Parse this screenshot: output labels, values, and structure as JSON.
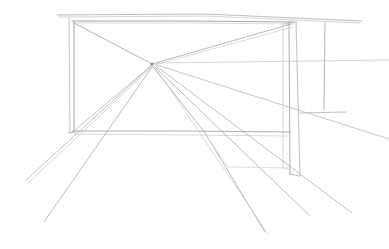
{
  "artwork": {
    "title": "One-point perspective room sketch",
    "medium": "graphite pencil on white paper",
    "subject": "interior architectural perspective construction with central vanishing point",
    "background_color": "#ffffff",
    "canvas": {
      "width": 389,
      "height": 249
    }
  },
  "palette": {
    "paper": "#ffffff",
    "line_dark": "#8d8d94",
    "line_mid": "#a9a9b0",
    "line_light": "#c2c2c8",
    "line_faint": "#d5d5da"
  },
  "geometry": {
    "vanishing_point": {
      "x": 152,
      "y": 64,
      "label": "VP"
    },
    "back_wall_rect": {
      "left": 72,
      "top": 21,
      "right": 294,
      "bottom": 133,
      "label": "back wall rectangle"
    },
    "horizon_line_y": 64
  },
  "strokes": [
    {
      "name": "ceiling-edge-upper-long",
      "d": "M 57 15 L 205 14 L 362 21",
      "color": "#a9a9b0",
      "width": 0.8
    },
    {
      "name": "ceiling-edge-lower-long",
      "d": "M 59 17 L 206 16 L 360 23",
      "color": "#c2c2c8",
      "width": 0.7
    },
    {
      "name": "back-wall-top-edge",
      "d": "M 72 21 L 186 21 L 294 22",
      "color": "#9a9aa2",
      "width": 0.9
    },
    {
      "name": "back-wall-top-edge-echo",
      "d": "M 73 23 L 188 23 L 293 24",
      "color": "#cfcfd4",
      "width": 0.7
    },
    {
      "name": "left-post-outer",
      "d": "M 69 18 L 70 133",
      "color": "#b4b4bb",
      "width": 0.8
    },
    {
      "name": "left-post-inner",
      "d": "M 74 22 L 74 132",
      "color": "#9a9aa2",
      "width": 0.9
    },
    {
      "name": "back-wall-floor-edge",
      "d": "M 72 131 L 186 131 L 290 132",
      "color": "#a4a4ac",
      "width": 0.9
    },
    {
      "name": "back-wall-floor-edge-echo",
      "d": "M 74 134 L 190 135 L 288 136",
      "color": "#c8c8ce",
      "width": 0.7
    },
    {
      "name": "right-column-front-left",
      "d": "M 289 22 L 290 174",
      "color": "#9e9ea6",
      "width": 0.9
    },
    {
      "name": "right-column-front-right",
      "d": "M 296 22 L 300 176",
      "color": "#aeaeb5",
      "width": 0.8
    },
    {
      "name": "right-column-back-edge",
      "d": "M 283 24 L 283 168",
      "color": "#c6c6cc",
      "width": 0.7
    },
    {
      "name": "right-column-base-front",
      "d": "M 289 174 L 300 176",
      "color": "#b0b0b7",
      "width": 0.8
    },
    {
      "name": "right-column-base-back",
      "d": "M 283 168 L 290 170",
      "color": "#cdcdd2",
      "width": 0.7
    },
    {
      "name": "diagonal-tl-to-vp",
      "d": "M 74 23 L 152 64",
      "color": "#a0a0a8",
      "width": 0.8
    },
    {
      "name": "diagonal-tr-to-vp",
      "d": "M 291 24 L 152 64",
      "color": "#a6a6ad",
      "width": 0.8
    },
    {
      "name": "diagonal-tr-to-vp-echo",
      "d": "M 293 27 L 154 65",
      "color": "#cacad0",
      "width": 0.7
    },
    {
      "name": "diagonal-bl-to-vp",
      "d": "M 75 130 L 152 65",
      "color": "#b6b6bd",
      "width": 0.8
    },
    {
      "name": "ray-vp-to-lower-left-a",
      "d": "M 151 66 L 25 181",
      "color": "#b2b2b9",
      "width": 0.8
    },
    {
      "name": "ray-vp-to-lower-left-b",
      "d": "M 153 66 L 28 183",
      "color": "#c6c6cc",
      "width": 0.7
    },
    {
      "name": "ray-vp-to-bottom-left",
      "d": "M 152 67 L 44 222",
      "color": "#a8a8b0",
      "width": 0.8
    },
    {
      "name": "ray-vp-to-bottom-center",
      "d": "M 153 67 L 205 133 L 265 232",
      "color": "#a4a4ac",
      "width": 0.8
    },
    {
      "name": "ray-vp-to-bottom-center-echo",
      "d": "M 155 67 L 268 234",
      "color": "#c8c8ce",
      "width": 0.7
    },
    {
      "name": "ray-vp-to-lower-right-a",
      "d": "M 155 67 L 310 216",
      "color": "#a8a8b0",
      "width": 0.8
    },
    {
      "name": "ray-vp-to-lower-right-b",
      "d": "M 156 66 L 352 213",
      "color": "#b0b0b7",
      "width": 0.8
    },
    {
      "name": "ray-vp-to-right-edge",
      "d": "M 157 65 L 389 139",
      "color": "#b8b8bf",
      "width": 0.8
    },
    {
      "name": "ray-vp-to-right-upper",
      "d": "M 157 63 L 389 60",
      "color": "#c4c4ca",
      "width": 0.7
    },
    {
      "name": "hanging-plumb-line",
      "d": "M 325 23 L 324 110",
      "color": "#a2a2aa",
      "width": 0.8
    },
    {
      "name": "shelf-horizontal-right",
      "d": "M 300 113 L 346 112",
      "color": "#aeaeb5",
      "width": 0.8
    },
    {
      "name": "floor-plane-right-edge",
      "d": "M 228 167 L 290 168",
      "color": "#d0d0d5",
      "width": 0.7
    },
    {
      "name": "floor-plane-diagonal",
      "d": "M 205 134 L 228 167",
      "color": "#d2d2d7",
      "width": 0.7
    },
    {
      "name": "right-column-top-tick",
      "d": "M 283 24 L 297 22",
      "color": "#b8b8bf",
      "width": 0.7
    },
    {
      "name": "left-post-base-tick",
      "d": "M 68 133 L 76 132",
      "color": "#aaaab2",
      "width": 0.8
    }
  ],
  "annotations": {
    "vanishing_point_marker": "convergence point of all perspective rays",
    "stroke_count": 31
  }
}
